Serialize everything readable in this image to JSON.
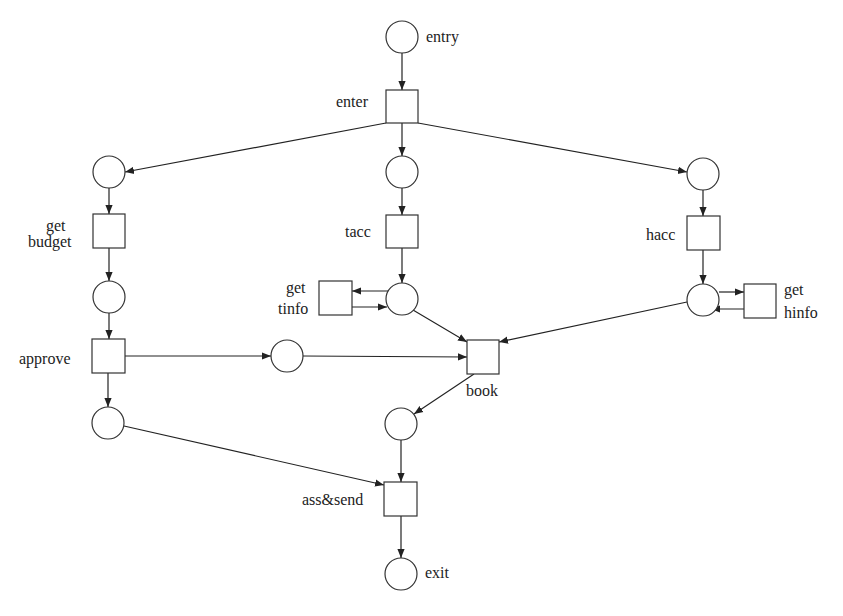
{
  "diagram": {
    "type": "petri-net",
    "places": [
      {
        "id": "p_entry",
        "label": "entry",
        "cx": 402,
        "cy": 37
      },
      {
        "id": "p_budget_in",
        "label": "",
        "cx": 109,
        "cy": 172
      },
      {
        "id": "p_tacc_in",
        "label": "",
        "cx": 402,
        "cy": 172
      },
      {
        "id": "p_hacc_in",
        "label": "",
        "cx": 703,
        "cy": 174
      },
      {
        "id": "p_budget_out",
        "label": "",
        "cx": 109,
        "cy": 297
      },
      {
        "id": "p_tinfo",
        "label": "",
        "cx": 402,
        "cy": 299
      },
      {
        "id": "p_hinfo",
        "label": "",
        "cx": 703,
        "cy": 300
      },
      {
        "id": "p_approved",
        "label": "",
        "cx": 287,
        "cy": 356
      },
      {
        "id": "p_approve_out",
        "label": "",
        "cx": 108,
        "cy": 423
      },
      {
        "id": "p_booked",
        "label": "",
        "cx": 401,
        "cy": 424
      },
      {
        "id": "p_exit",
        "label": "exit",
        "cx": 401,
        "cy": 574
      }
    ],
    "transitions": [
      {
        "id": "t_enter",
        "label": [
          "enter"
        ],
        "x": 386,
        "y": 90
      },
      {
        "id": "t_get_budget",
        "label": [
          "get",
          "budget"
        ],
        "x": 93,
        "y": 214
      },
      {
        "id": "t_tacc",
        "label": [
          "tacc"
        ],
        "x": 386,
        "y": 215
      },
      {
        "id": "t_hacc",
        "label": [
          "hacc"
        ],
        "x": 687,
        "y": 216
      },
      {
        "id": "t_get_tinfo",
        "label": [
          "get",
          "tinfo"
        ],
        "x": 319,
        "y": 281
      },
      {
        "id": "t_get_hinfo",
        "label": [
          "get",
          "hinfo"
        ],
        "x": 744,
        "y": 284
      },
      {
        "id": "t_approve",
        "label": [
          "approve"
        ],
        "x": 92,
        "y": 339
      },
      {
        "id": "t_book",
        "label": [
          "book"
        ],
        "x": 467,
        "y": 340
      },
      {
        "id": "t_ass_send",
        "label": [
          "ass&send"
        ],
        "x": 384,
        "y": 482
      }
    ],
    "labels": {
      "entry": "entry",
      "enter": "enter",
      "get_budget_1": "get",
      "get_budget_2": "budget",
      "tacc": "tacc",
      "hacc": "hacc",
      "get_tinfo_1": "get",
      "get_tinfo_2": "tinfo",
      "get_hinfo_1": "get",
      "get_hinfo_2": "hinfo",
      "approve": "approve",
      "book": "book",
      "ass_send": "ass&send",
      "exit": "exit"
    },
    "arcs": [
      [
        "p_entry",
        "t_enter"
      ],
      [
        "t_enter",
        "p_budget_in"
      ],
      [
        "t_enter",
        "p_tacc_in"
      ],
      [
        "t_enter",
        "p_hacc_in"
      ],
      [
        "p_budget_in",
        "t_get_budget"
      ],
      [
        "t_get_budget",
        "p_budget_out"
      ],
      [
        "p_budget_out",
        "t_approve"
      ],
      [
        "t_approve",
        "p_approved"
      ],
      [
        "t_approve",
        "p_approve_out"
      ],
      [
        "p_approved",
        "t_book"
      ],
      [
        "p_tacc_in",
        "t_tacc"
      ],
      [
        "t_tacc",
        "p_tinfo"
      ],
      [
        "p_tinfo",
        "t_get_tinfo"
      ],
      [
        "t_get_tinfo",
        "p_tinfo"
      ],
      [
        "p_tinfo",
        "t_book"
      ],
      [
        "p_hacc_in",
        "t_hacc"
      ],
      [
        "t_hacc",
        "p_hinfo"
      ],
      [
        "p_hinfo",
        "t_get_hinfo"
      ],
      [
        "t_get_hinfo",
        "p_hinfo"
      ],
      [
        "p_hinfo",
        "t_book"
      ],
      [
        "t_book",
        "p_booked"
      ],
      [
        "p_booked",
        "t_ass_send"
      ],
      [
        "p_approve_out",
        "t_ass_send"
      ],
      [
        "t_ass_send",
        "p_exit"
      ]
    ]
  }
}
